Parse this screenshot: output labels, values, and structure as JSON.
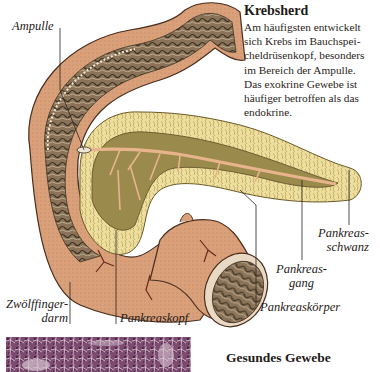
{
  "info": {
    "title": "Krebsherd",
    "lines": [
      "Am häufigsten entwickelt",
      "sich Krebs im Bauchspei-",
      "cheldrüsenkopf, besonders",
      "im Bereich der Ampulle.",
      "Das exokrine Gewebe ist",
      "häufiger betroffen als das",
      "endokrine."
    ]
  },
  "labels": {
    "ampulle": "Ampulle",
    "pankreasschwanz_line1": "Pankreas-",
    "pankreasschwanz_line2": "schwanz",
    "pankreasgang_line1": "Pankreas-",
    "pankreasgang_line2": "gang",
    "pankreaskoerper": "Pankreaskörper",
    "zwoelffingerdarm_line1": "Zwölffinger-",
    "zwoelffingerdarm_line2": "darm",
    "pankreaskopf": "Pankreaskopf"
  },
  "tissue": {
    "caption": "Gesundes Gewebe"
  },
  "colors": {
    "duodenum_skin": "#d9a07a",
    "duodenum_inner": "#8a7358",
    "pancreas_tissue": "#eedf9e",
    "pancreas_core": "#9a8a4c",
    "duct": "#e8b48c",
    "tissue_stain": "#8a4f78"
  }
}
